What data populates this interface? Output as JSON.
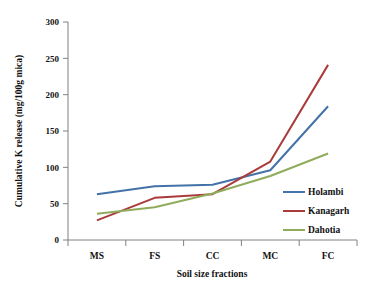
{
  "chart_data": {
    "type": "line",
    "title": "",
    "xlabel": "Soil size fractions",
    "ylabel": "Cumulative K release (mg/100g mica)",
    "categories": [
      "MS",
      "FS",
      "CC",
      "MC",
      "FC"
    ],
    "ylim": [
      0,
      300
    ],
    "yticks": [
      0,
      50,
      100,
      150,
      200,
      250,
      300
    ],
    "ytick_labels": [
      "0",
      "50",
      "100",
      "150",
      "200",
      "250",
      "300"
    ],
    "grid": false,
    "legend_position": "right-inside",
    "series": [
      {
        "name": "Holambi",
        "color": "#4472A8",
        "values": [
          63,
          74,
          76,
          96,
          184
        ]
      },
      {
        "name": "Kanagarh",
        "color": "#A93B3B",
        "values": [
          27,
          58,
          63,
          108,
          241
        ]
      },
      {
        "name": "Dahotia",
        "color": "#8FAC5C",
        "values": [
          36,
          45,
          64,
          88,
          119
        ]
      }
    ]
  },
  "legend": {
    "items": [
      {
        "label": "Holambi",
        "color": "#4472A8"
      },
      {
        "label": "Kanagarh",
        "color": "#A93B3B"
      },
      {
        "label": "Dahotia",
        "color": "#8FAC5C"
      }
    ]
  }
}
